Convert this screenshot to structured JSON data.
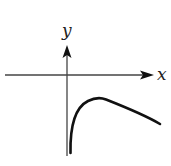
{
  "figure": {
    "type": "function-graph-sketch",
    "axes": {
      "x_label": "x",
      "y_label": "y"
    },
    "curve": {
      "description": "Curve lying entirely below the x-axis for x > 0; plunges toward negative infinity as x approaches 0 from the right (y-axis is a vertical asymptote), rises to a single maximum below the x-axis, then decreases slowly as x increases.",
      "region": "fourth quadrant",
      "has_maximum": true,
      "asymptote": "x = 0"
    },
    "colors": {
      "axis": "#444444",
      "curve": "#111111",
      "background": "#ffffff"
    }
  }
}
